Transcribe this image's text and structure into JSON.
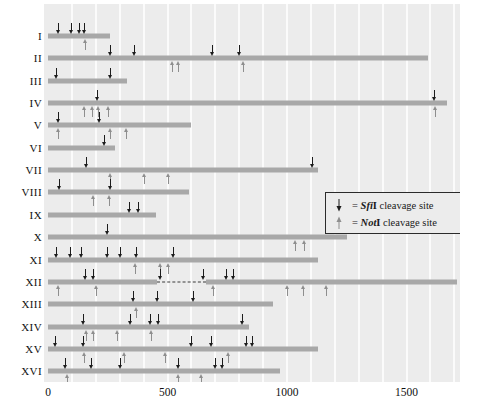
{
  "figure": {
    "bar_color": "#a8a8a8",
    "plot_background": "#ececec",
    "sfi_color": "#1c1c1c",
    "not_color": "#8e8e8e"
  },
  "axis": {
    "unit": "kb",
    "min": 0,
    "max": 1730,
    "ticks": [
      {
        "value": 0,
        "label": "0"
      },
      {
        "value": 500,
        "label": "500"
      },
      {
        "value": 1000,
        "label": "1000"
      },
      {
        "value": 1500,
        "label": "1500"
      }
    ],
    "gridlines": [
      100,
      200,
      300,
      400,
      500,
      600,
      700,
      800,
      900,
      1000,
      1100,
      1200,
      1300,
      1400,
      1500,
      1600,
      1700
    ]
  },
  "legend": {
    "items": [
      {
        "glyph": "sfi-arrow-icon",
        "eq": "=",
        "enzyme_italic": "Sfi",
        "enzyme_roman": "I",
        "text": "cleavage site"
      },
      {
        "glyph": "not-arrow-icon",
        "eq": "=",
        "enzyme_italic": "Not",
        "enzyme_roman": "I",
        "text": "cleavage site"
      }
    ]
  },
  "chart_data": {
    "type": "bar",
    "xlabel": "kb",
    "ylabel": "Chromosome",
    "xlim": [
      0,
      1730
    ],
    "grid": true,
    "legend_position": "inside-right",
    "categories": [
      "I",
      "II",
      "III",
      "IV",
      "V",
      "VI",
      "VII",
      "VIII",
      "IX",
      "X",
      "XI",
      "XII",
      "XIII",
      "XIV",
      "XV",
      "XVI"
    ],
    "values": [
      260,
      1590,
      330,
      1670,
      600,
      280,
      1130,
      590,
      450,
      1250,
      1130,
      1710,
      940,
      840,
      1130,
      970
    ],
    "chromosomes": [
      {
        "name": "I",
        "length_kb": 260,
        "sfi_sites": [
          40,
          95,
          130,
          150
        ],
        "not_sites": [
          155
        ]
      },
      {
        "name": "II",
        "length_kb": 1590,
        "sfi_sites": [
          260,
          360,
          685,
          800
        ],
        "not_sites": [
          520,
          545,
          815
        ]
      },
      {
        "name": "III",
        "length_kb": 330,
        "sfi_sites": [
          35,
          260
        ],
        "not_sites": []
      },
      {
        "name": "IV",
        "length_kb": 1670,
        "sfi_sites": [
          205,
          1615
        ],
        "not_sites": [
          150,
          185,
          210,
          250,
          1620
        ]
      },
      {
        "name": "V",
        "length_kb": 600,
        "sfi_sites": [
          40,
          215
        ],
        "not_sites": [
          40,
          260,
          325
        ]
      },
      {
        "name": "VI",
        "length_kb": 280,
        "sfi_sites": [
          235
        ],
        "not_sites": []
      },
      {
        "name": "VII",
        "length_kb": 1130,
        "sfi_sites": [
          160,
          1105
        ],
        "not_sites": [
          260,
          400,
          500
        ]
      },
      {
        "name": "VIII",
        "length_kb": 590,
        "sfi_sites": [
          45,
          260
        ],
        "not_sites": [
          190,
          255
        ]
      },
      {
        "name": "IX",
        "length_kb": 450,
        "sfi_sites": [
          340,
          375
        ],
        "not_sites": []
      },
      {
        "name": "X",
        "length_kb": 1250,
        "sfi_sites": [
          245
        ],
        "not_sites": [
          1035,
          1070
        ]
      },
      {
        "name": "XI",
        "length_kb": 1130,
        "sfi_sites": [
          35,
          90,
          140,
          245,
          300,
          370,
          525
        ],
        "not_sites": [
          365,
          470,
          500
        ]
      },
      {
        "name": "XII",
        "length_kb": 1710,
        "sfi_sites": [
          155,
          190,
          470,
          650,
          745,
          775
        ],
        "not_sites": [
          40,
          200,
          690,
          1000,
          1065,
          1165
        ],
        "gap": {
          "start_kb": 455,
          "end_kb": 660,
          "label": "rDNA-repeat-region"
        }
      },
      {
        "name": "XIII",
        "length_kb": 940,
        "sfi_sites": [
          355,
          455,
          605
        ],
        "not_sites": [
          370
        ]
      },
      {
        "name": "XIV",
        "length_kb": 840,
        "sfi_sites": [
          145,
          345,
          425,
          460,
          810
        ],
        "not_sites": [
          160,
          190,
          290,
          430
        ]
      },
      {
        "name": "XV",
        "length_kb": 1130,
        "sfi_sites": [
          30,
          145,
          600,
          680,
          830,
          855
        ],
        "not_sites": [
          150,
          320,
          490,
          755
        ]
      },
      {
        "name": "XVI",
        "length_kb": 970,
        "sfi_sites": [
          70,
          180,
          300,
          545,
          700,
          730
        ],
        "not_sites": [
          80,
          545,
          640
        ]
      }
    ]
  }
}
